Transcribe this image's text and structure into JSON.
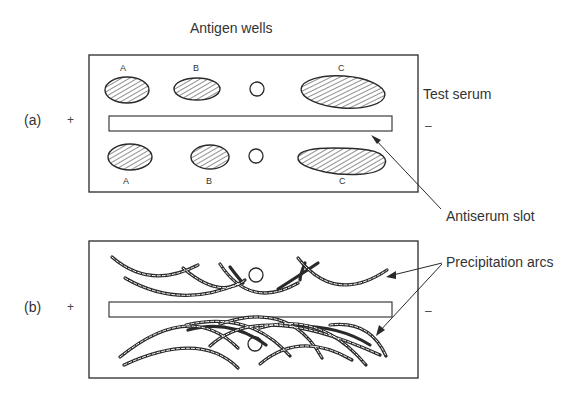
{
  "figure": {
    "header": "Antigen wells",
    "panels": [
      {
        "id": "a",
        "label": "(a)",
        "plus": "+",
        "minus": "–",
        "wells_top": [
          {
            "letter": "A",
            "type": "hatched"
          },
          {
            "letter": "B",
            "type": "hatched"
          },
          {
            "letter": "",
            "type": "empty-circle"
          },
          {
            "letter": "C",
            "type": "hatched"
          }
        ],
        "wells_bottom": [
          {
            "letter": "A",
            "type": "hatched"
          },
          {
            "letter": "B",
            "type": "hatched"
          },
          {
            "letter": "",
            "type": "empty-circle"
          },
          {
            "letter": "C",
            "type": "hatched"
          }
        ]
      },
      {
        "id": "b",
        "label": "(b)",
        "plus": "+",
        "minus": "–"
      }
    ],
    "annotations": {
      "test_serum": "Test serum",
      "antiserum_slot": "Antiserum slot",
      "precipitation_arcs": "Precipitation arcs"
    },
    "colors": {
      "line": "#2a2a2a",
      "background": "#ffffff"
    }
  }
}
